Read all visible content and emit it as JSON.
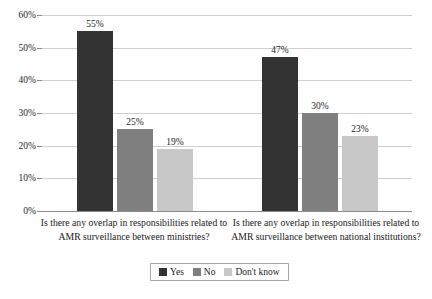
{
  "chart_data": {
    "type": "bar",
    "title": "",
    "subtitle": "",
    "xlabel": "",
    "ylabel": "",
    "ylim": [
      0,
      60
    ],
    "ytick_labels": [
      "0%",
      "10%",
      "20%",
      "30%",
      "40%",
      "50%",
      "60%"
    ],
    "ytick_values": [
      0,
      10,
      20,
      30,
      40,
      50,
      60
    ],
    "grid": true,
    "legend_position": "bottom",
    "value_suffix": "%",
    "categories": [
      "Is there any overlap in responsibilities related to AMR surveillance between ministries?",
      "Is there any overlap in responsibilities related to AMR surveillance between national institutions?"
    ],
    "series": [
      {
        "name": "Yes",
        "color": "#333333",
        "values": [
          55,
          47
        ],
        "labels": [
          "55%",
          "47%"
        ]
      },
      {
        "name": "No",
        "color": "#7f7f7f",
        "values": [
          25,
          30
        ],
        "labels": [
          "25%",
          "30%"
        ]
      },
      {
        "name": "Don't know",
        "color": "#c8c8c8",
        "values": [
          19,
          23
        ],
        "labels": [
          "19%",
          "23%"
        ]
      }
    ]
  },
  "legend": {
    "items": [
      {
        "label": "Yes",
        "color": "#333333"
      },
      {
        "label": "No",
        "color": "#7f7f7f"
      },
      {
        "label": "Don't know",
        "color": "#c8c8c8"
      }
    ]
  },
  "axis": {
    "y_ticks": [
      {
        "label": "60%"
      },
      {
        "label": "50%"
      },
      {
        "label": "40%"
      },
      {
        "label": "30%"
      },
      {
        "label": "20%"
      },
      {
        "label": "10%"
      },
      {
        "label": "0%"
      }
    ]
  },
  "colors": {
    "gridline": "#d0d0d0",
    "axis": "#8c8c8c",
    "text": "#1a1a1a",
    "background": "#ffffff"
  }
}
